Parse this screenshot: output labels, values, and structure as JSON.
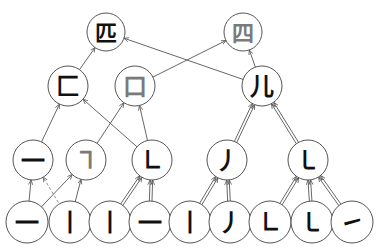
{
  "diagram": {
    "colors": {
      "stroke": "#555555",
      "node_fill": "#ffffff",
      "black_glyph": "#111111",
      "gray_glyph": "#7a7a7a",
      "dashed_edge": "#888888"
    },
    "levels": [
      {
        "level": 1,
        "nodes": [
          {
            "id": "n_pi",
            "label": "匹",
            "color": "black"
          },
          {
            "id": "n_si",
            "label": "四",
            "color": "gray"
          }
        ]
      },
      {
        "level": 2,
        "nodes": [
          {
            "id": "n_fang",
            "label": "匚",
            "color": "black"
          },
          {
            "id": "n_kou",
            "label": "口",
            "color": "gray"
          },
          {
            "id": "n_er",
            "label": "儿",
            "color": "black"
          }
        ]
      },
      {
        "level": 3,
        "nodes": [
          {
            "id": "n_heng",
            "label": "一",
            "color": "black"
          },
          {
            "id": "n_hengzhe",
            "label": "㇕",
            "color": "gray"
          },
          {
            "id": "n_shuzhe",
            "label": "㇗",
            "color": "black"
          },
          {
            "id": "n_pie",
            "label": "丿",
            "color": "black"
          },
          {
            "id": "n_shuwangou",
            "label": "㇄",
            "color": "black"
          }
        ]
      },
      {
        "level": 4,
        "nodes": [
          {
            "id": "p1",
            "label": "一",
            "color": "black"
          },
          {
            "id": "p2",
            "label": "丨",
            "color": "black"
          },
          {
            "id": "p3",
            "label": "丨",
            "color": "black"
          },
          {
            "id": "p4",
            "label": "一",
            "color": "black"
          },
          {
            "id": "p5",
            "label": "丨",
            "color": "black"
          },
          {
            "id": "p6",
            "label": "丿",
            "color": "black"
          },
          {
            "id": "p7",
            "label": "㇗",
            "color": "black"
          },
          {
            "id": "p8",
            "label": "㇄",
            "color": "black"
          },
          {
            "id": "p9",
            "label": "㇀",
            "color": "black"
          }
        ]
      }
    ],
    "edges": [
      {
        "from": "n_fang",
        "to": "n_pi",
        "style": "single"
      },
      {
        "from": "n_er",
        "to": "n_pi",
        "style": "single"
      },
      {
        "from": "n_kou",
        "to": "n_si",
        "style": "single"
      },
      {
        "from": "n_er",
        "to": "n_si",
        "style": "single"
      },
      {
        "from": "n_heng",
        "to": "n_fang",
        "style": "single"
      },
      {
        "from": "n_shuzhe",
        "to": "n_fang",
        "style": "single"
      },
      {
        "from": "n_hengzhe",
        "to": "n_kou",
        "style": "single"
      },
      {
        "from": "n_shuzhe",
        "to": "n_kou",
        "style": "single"
      },
      {
        "from": "n_pie",
        "to": "n_er",
        "style": "double"
      },
      {
        "from": "n_shuwangou",
        "to": "n_er",
        "style": "double"
      },
      {
        "from": "p1",
        "to": "n_heng",
        "style": "single"
      },
      {
        "from": "p1",
        "to": "n_hengzhe",
        "style": "single"
      },
      {
        "from": "p2",
        "to": "n_heng",
        "style": "dashed"
      },
      {
        "from": "p2",
        "to": "n_hengzhe",
        "style": "single"
      },
      {
        "from": "p3",
        "to": "n_shuzhe",
        "style": "double"
      },
      {
        "from": "p4",
        "to": "n_shuzhe",
        "style": "double"
      },
      {
        "from": "p5",
        "to": "n_pie",
        "style": "double"
      },
      {
        "from": "p6",
        "to": "n_pie",
        "style": "double"
      },
      {
        "from": "p7",
        "to": "n_shuwangou",
        "style": "double"
      },
      {
        "from": "p8",
        "to": "n_shuwangou",
        "style": "double"
      },
      {
        "from": "p9",
        "to": "n_shuwangou",
        "style": "double"
      }
    ]
  }
}
